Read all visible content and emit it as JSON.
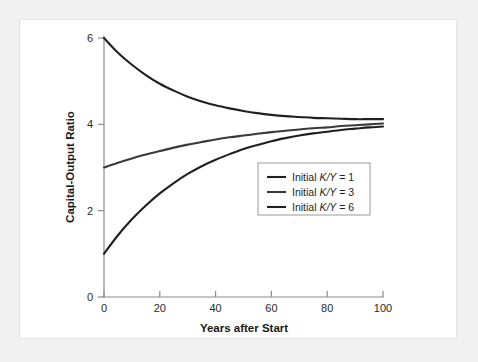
{
  "figure": {
    "background_color": "#f1f1f1",
    "panel_color": "#ffffff"
  },
  "chart_data": {
    "type": "line",
    "title": "",
    "xlabel": "Years after Start",
    "ylabel": "Capital-Output Ratio",
    "xlim": [
      0,
      100
    ],
    "ylim": [
      0,
      6
    ],
    "xticks": [
      0,
      20,
      40,
      60,
      80,
      100
    ],
    "xtick_labels": [
      "0",
      "20",
      "40",
      "60",
      "80",
      "100"
    ],
    "yticks": [
      0,
      2,
      4,
      6
    ],
    "ytick_labels": [
      "0",
      "2",
      "4",
      "6"
    ],
    "grid": false,
    "legend_position": "center-right",
    "axis_color": "#8c8c8c",
    "series": [
      {
        "name": "Initial K/Y = 1",
        "legend_prefix": "Initial ",
        "legend_var": "K/Y",
        "legend_suffix": " = 1",
        "color": "#231f20",
        "initial_value": 1,
        "converges_to": 3.95,
        "x": [
          0,
          5,
          10,
          15,
          20,
          25,
          30,
          35,
          40,
          45,
          50,
          55,
          60,
          65,
          70,
          75,
          80,
          85,
          90,
          95,
          100
        ],
        "values": [
          1.0,
          1.43,
          1.8,
          2.12,
          2.4,
          2.64,
          2.85,
          3.03,
          3.18,
          3.31,
          3.43,
          3.52,
          3.61,
          3.68,
          3.74,
          3.79,
          3.83,
          3.87,
          3.9,
          3.93,
          3.95
        ]
      },
      {
        "name": "Initial K/Y = 3",
        "legend_prefix": "Initial ",
        "legend_var": "K/Y",
        "legend_suffix": " = 3",
        "color": "#3a3a3c",
        "initial_value": 3,
        "converges_to": 4.02,
        "x": [
          0,
          5,
          10,
          15,
          20,
          25,
          30,
          35,
          40,
          45,
          50,
          55,
          60,
          65,
          70,
          75,
          80,
          85,
          90,
          95,
          100
        ],
        "values": [
          3.0,
          3.11,
          3.21,
          3.3,
          3.38,
          3.46,
          3.53,
          3.59,
          3.65,
          3.7,
          3.74,
          3.78,
          3.82,
          3.85,
          3.88,
          3.91,
          3.93,
          3.96,
          3.98,
          4.0,
          4.02
        ]
      },
      {
        "name": "Initial K/Y = 6",
        "legend_prefix": "Initial ",
        "legend_var": "K/Y",
        "legend_suffix": " = 6",
        "color": "#231f20",
        "initial_value": 6,
        "converges_to": 4.12,
        "x": [
          0,
          5,
          10,
          15,
          20,
          25,
          30,
          35,
          40,
          45,
          50,
          55,
          60,
          65,
          70,
          75,
          80,
          85,
          90,
          95,
          100
        ],
        "values": [
          6.0,
          5.66,
          5.38,
          5.14,
          4.94,
          4.78,
          4.64,
          4.53,
          4.44,
          4.37,
          4.31,
          4.26,
          4.22,
          4.19,
          4.17,
          4.15,
          4.14,
          4.13,
          4.12,
          4.12,
          4.12
        ]
      }
    ]
  }
}
